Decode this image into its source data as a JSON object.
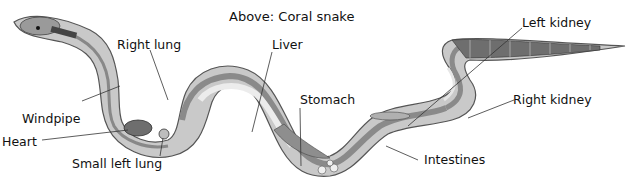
{
  "diagram": {
    "title": "Above: Coral snake",
    "labels": {
      "windpipe": "Windpipe",
      "heart": "Heart",
      "small_left_lung": "Small left lung",
      "right_lung": "Right lung",
      "liver": "Liver",
      "stomach": "Stomach",
      "intestines": "Intestines",
      "left_kidney": "Left kidney",
      "right_kidney": "Right kidney"
    },
    "colors": {
      "body_outline": "#555555",
      "body_fill": "#c9c9c9",
      "inner_band": "#a9a9a9",
      "pale_organ": "#e6e6e6",
      "dark_organ": "#777777",
      "scale_dark": "#555555"
    }
  }
}
